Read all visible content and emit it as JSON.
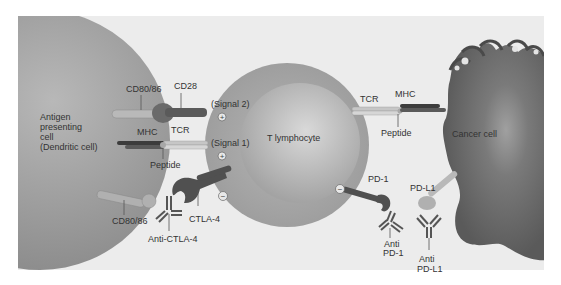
{
  "colors": {
    "panel_bg": "#ececec",
    "apc_cell": "#9a9a9a",
    "t_cell_outer": "#a9a9a9",
    "t_cell_inner": "#bdbdbd",
    "cancer_cell": "#6e6e6e",
    "receptor_dark": "#555555",
    "receptor_light": "#b9b9b9",
    "label_text": "#333333"
  },
  "cells": {
    "apc": {
      "label_lines": [
        "Antigen",
        "presenting",
        "cell",
        "(Dendritic cell)"
      ]
    },
    "t_cell": {
      "label": "T lymphocyte"
    },
    "cancer": {
      "label": "Cancer cell"
    }
  },
  "labels": {
    "cd80_top": "CD80/86",
    "cd28": "CD28",
    "signal2": "(Signal 2)",
    "mhc_left": "MHC",
    "tcr_left": "TCR",
    "signal1": "(Signal 1)",
    "peptide_left": "Peptide",
    "cd80_bottom": "CD80/86",
    "ctla4": "CTLA-4",
    "anti_ctla4": "Anti-CTLA-4",
    "tcr_right": "TCR",
    "mhc_right": "MHC",
    "peptide_right": "Peptide",
    "pd1": "PD-1",
    "pdl1": "PD-L1",
    "anti_pd1_lines": [
      "Anti",
      "PD-1"
    ],
    "anti_pdl1_lines": [
      "Anti",
      "PD-L1"
    ]
  },
  "signs": {
    "plus": "+",
    "minus": "−"
  }
}
